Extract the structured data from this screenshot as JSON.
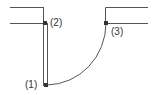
{
  "diagram": {
    "type": "door-swing plan",
    "stroke_color": "#444444",
    "marker_color": "#333333",
    "points": [
      {
        "id": "p1",
        "label": "(1)",
        "x": 46,
        "y": 85,
        "label_x": 25,
        "label_y": 80
      },
      {
        "id": "p2",
        "label": "(2)",
        "x": 45,
        "y": 23,
        "label_x": 50,
        "label_y": 18
      },
      {
        "id": "p3",
        "label": "(3)",
        "x": 106,
        "y": 23,
        "label_x": 111,
        "label_y": 27
      }
    ]
  }
}
